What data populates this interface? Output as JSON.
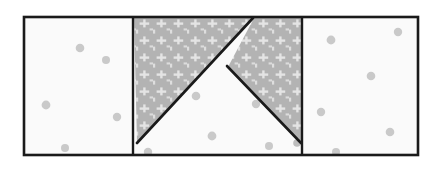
{
  "figure": {
    "title": "Rectangle divided into three vertical panels with a central shaded chevron",
    "background_color": "#ffffff",
    "canvas": {
      "width": 444,
      "height": 172
    }
  },
  "outer_rectangle": {
    "name": "outer-rectangle",
    "x": 24,
    "y": 17,
    "width": 394,
    "height": 138,
    "stroke_color": "#1a1a1a",
    "stroke_width": 2.6,
    "fill_color": "#fafafa"
  },
  "dividers": [
    {
      "name": "left-divider",
      "x": 133,
      "y1": 17,
      "y2": 155,
      "stroke_color": "#1a1a1a",
      "stroke_width": 2.4
    },
    {
      "name": "right-divider",
      "x": 302,
      "y1": 17,
      "y2": 155,
      "stroke_color": "#1a1a1a",
      "stroke_width": 2.4
    }
  ],
  "panels": [
    {
      "name": "left-panel",
      "fill_color": "#fafafa",
      "x": 24,
      "y": 17,
      "width": 109,
      "height": 138
    },
    {
      "name": "middle-panel",
      "fill_color": "#fafafa",
      "x": 133,
      "y": 17,
      "width": 169,
      "height": 138
    },
    {
      "name": "right-panel",
      "fill_color": "#fafafa",
      "x": 302,
      "y": 17,
      "width": 116,
      "height": 138
    }
  ],
  "shaded_regions": [
    {
      "name": "left-shaded-triangle",
      "points": "134,18 252,18 137,143",
      "fill_color": "#b5b5b5",
      "texture": "light-cross-speckle"
    },
    {
      "name": "right-shaded-triangle",
      "points": "254,18 301,18 301,142 228,67",
      "fill_color": "#b5b5b5",
      "texture": "light-cross-speckle"
    }
  ],
  "diagonals": [
    {
      "name": "left-diagonal-line",
      "x1": 137,
      "y1": 143,
      "x2": 253,
      "y2": 18,
      "stroke_color": "#1a1a1a",
      "stroke_width": 2.6
    },
    {
      "name": "right-diagonal-line",
      "x1": 227,
      "y1": 66,
      "x2": 301,
      "y2": 143,
      "stroke_color": "#1a1a1a",
      "stroke_width": 2.6
    }
  ],
  "speckle_dots": {
    "fill_color": "#c9c9c9",
    "left_panel": [
      {
        "cx": 80,
        "cy": 48,
        "r": 4.3
      },
      {
        "cx": 106,
        "cy": 60,
        "r": 4.0
      },
      {
        "cx": 46,
        "cy": 105,
        "r": 4.4
      },
      {
        "cx": 117,
        "cy": 117,
        "r": 4.2
      },
      {
        "cx": 65,
        "cy": 148,
        "r": 4.0
      }
    ],
    "middle_panel": [
      {
        "cx": 196,
        "cy": 96,
        "r": 4.3
      },
      {
        "cx": 256,
        "cy": 104,
        "r": 4.2
      },
      {
        "cx": 212,
        "cy": 136,
        "r": 4.4
      },
      {
        "cx": 269,
        "cy": 146,
        "r": 4.0
      },
      {
        "cx": 148,
        "cy": 152,
        "r": 4.2
      },
      {
        "cx": 297,
        "cy": 143,
        "r": 3.8
      }
    ],
    "right_panel": [
      {
        "cx": 398,
        "cy": 32,
        "r": 4.2
      },
      {
        "cx": 331,
        "cy": 40,
        "r": 4.4
      },
      {
        "cx": 371,
        "cy": 76,
        "r": 4.3
      },
      {
        "cx": 321,
        "cy": 112,
        "r": 4.2
      },
      {
        "cx": 390,
        "cy": 132,
        "r": 4.3
      },
      {
        "cx": 336,
        "cy": 152,
        "r": 4.0
      }
    ]
  },
  "texture": {
    "name": "light-cross-speckle",
    "mark_color": "#e2e2e2",
    "base_color": "#b3b3b3",
    "tile_size": 17
  }
}
